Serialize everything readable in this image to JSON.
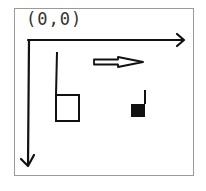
{
  "diagram": {
    "type": "coordinate-sketch",
    "origin_label": "(0,0)",
    "axes": {
      "x": {
        "direction": "right",
        "arrow": true
      },
      "y": {
        "direction": "down",
        "arrow": true
      }
    },
    "shapes": [
      {
        "name": "hollow-square-with-stem",
        "fill": "none",
        "stroke": "#111111"
      },
      {
        "name": "motion-arrow",
        "style": "hollow-double-line",
        "direction": "right"
      },
      {
        "name": "filled-square-with-stem",
        "fill": "#111111",
        "stroke": "#111111"
      }
    ],
    "colors": {
      "ink": "#111111",
      "frame": "#9a9a9a",
      "background": "#ffffff"
    }
  }
}
